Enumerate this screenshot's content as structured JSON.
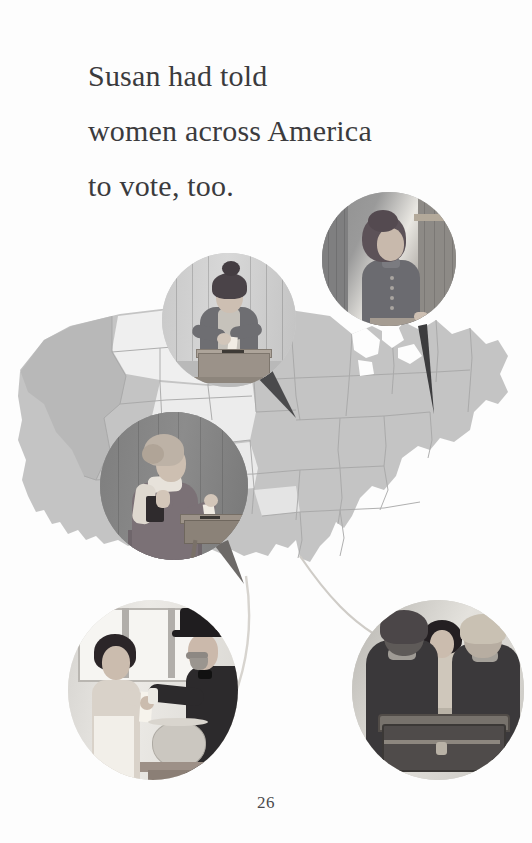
{
  "page": {
    "number": "26",
    "background_color": "#fdfdfd",
    "text_color": "#3b3b3d",
    "width": 532,
    "height": 843
  },
  "body_text": {
    "line1": "Susan had told",
    "line2": "women across America",
    "line3": "to vote, too.",
    "full": "Susan had told women across America to vote, too."
  },
  "illustration": {
    "map": {
      "name": "united-states-map",
      "description": "Stylized grayscale map of the contiguous United States with state borders",
      "fill_color": "#bfbfbf",
      "light_fill_color": "#eeeeee",
      "border_color": "#a5a5a5"
    },
    "vignettes": [
      {
        "id": "vignette-woman-ballot-box",
        "label": "Woman dropping a ballot into a wooden ballot box",
        "position": "upper-left",
        "shape": "circle"
      },
      {
        "id": "vignette-woman-at-desk",
        "label": "Woman in a buttoned dress writing at a desk in a doorway",
        "position": "upper-right",
        "shape": "circle"
      },
      {
        "id": "vignette-older-woman-voting",
        "label": "Older woman holding a book and placing a ballot in a box",
        "position": "center-left",
        "shape": "circle"
      },
      {
        "id": "vignette-woman-and-man-top-hat",
        "label": "Woman in apron handing a ballot to a man in a top hat beside a glass ballot jar",
        "position": "bottom-left",
        "shape": "circle"
      },
      {
        "id": "vignette-voters-at-ballot-chest",
        "label": "Two men in dark coats and a woman standing behind a ballot chest",
        "position": "bottom-right",
        "shape": "circle"
      }
    ],
    "pointers": [
      {
        "id": "pointer-upper-left",
        "from": "vignette-woman-ballot-box",
        "to": "map"
      },
      {
        "id": "pointer-upper-right",
        "from": "vignette-woman-at-desk",
        "to": "map"
      },
      {
        "id": "pointer-center-left",
        "from": "vignette-older-woman-voting",
        "to": "map"
      },
      {
        "id": "pointer-bottom-left",
        "from": "vignette-woman-and-man-top-hat",
        "to": "map"
      },
      {
        "id": "pointer-bottom-right",
        "from": "vignette-voters-at-ballot-chest",
        "to": "map"
      }
    ]
  }
}
